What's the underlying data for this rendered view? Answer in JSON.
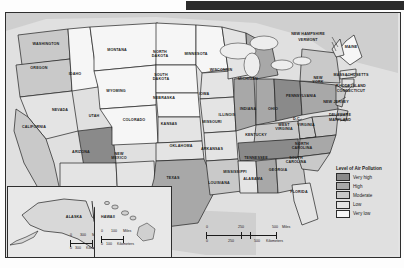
{
  "document": {
    "type": "thematic-choropleth-map",
    "region": "United States",
    "topic": "Level of Air Pollution"
  },
  "legend": {
    "title": "Level of Air Pollution",
    "items": [
      {
        "label": "Very high",
        "color": "#8a8a8a"
      },
      {
        "label": "High",
        "color": "#a8a8a8"
      },
      {
        "label": "Moderate",
        "color": "#c9c9c9"
      },
      {
        "label": "Low",
        "color": "#e4e4e4"
      },
      {
        "label": "Very low",
        "color": "#f6f6f6"
      }
    ]
  },
  "scales": {
    "main": {
      "miles": {
        "ticks": [
          "0",
          "250",
          "500"
        ],
        "unit": "Miles"
      },
      "kilometers": {
        "ticks": [
          "0",
          "250",
          "500"
        ],
        "unit": "Kilometers"
      }
    },
    "alaska": {
      "miles": {
        "ticks": [
          "0",
          "300"
        ],
        "unit": "Miles"
      },
      "kilometers": {
        "ticks": [
          "0",
          "300"
        ],
        "unit": "Kilometers"
      }
    },
    "hawaii": {
      "miles": {
        "ticks": [
          "0",
          "100"
        ],
        "unit": "Miles"
      },
      "kilometers": {
        "ticks": [
          "0",
          "100"
        ],
        "unit": "Kilometers"
      }
    }
  },
  "insets": {
    "alaska": {
      "label": "ALASKA"
    },
    "hawaii": {
      "label": "HAWAII"
    }
  },
  "states": [
    {
      "name": "WASHINGTON",
      "level": "Moderate",
      "x": 40,
      "y": 32,
      "size": "sm"
    },
    {
      "name": "OREGON",
      "level": "Moderate",
      "x": 33,
      "y": 56,
      "size": "sm"
    },
    {
      "name": "IDAHO",
      "level": "Very low",
      "x": 69,
      "y": 62,
      "size": "sm"
    },
    {
      "name": "MONTANA",
      "level": "Very low",
      "x": 111,
      "y": 38,
      "size": "sm"
    },
    {
      "name": "WYOMING",
      "level": "Very low",
      "x": 110,
      "y": 79,
      "size": "sm"
    },
    {
      "name": "NEVADA",
      "level": "Low",
      "x": 54,
      "y": 98,
      "size": "sm"
    },
    {
      "name": "UTAH",
      "level": "Very high",
      "x": 88,
      "y": 104,
      "size": "sm"
    },
    {
      "name": "CALIFORNIA",
      "level": "Moderate",
      "x": 28,
      "y": 115,
      "size": "sm"
    },
    {
      "name": "ARIZONA",
      "level": "Low",
      "x": 75,
      "y": 140,
      "size": "sm"
    },
    {
      "name": "NEW\nMEXICO",
      "level": "Low",
      "x": 113,
      "y": 142,
      "size": "sm"
    },
    {
      "name": "COLORADO",
      "level": "Very low",
      "x": 128,
      "y": 108,
      "size": "sm"
    },
    {
      "name": "NORTH\nDAKOTA",
      "level": "Very low",
      "x": 154,
      "y": 40,
      "size": "sm"
    },
    {
      "name": "SOUTH\nDAKOTA",
      "level": "Very low",
      "x": 155,
      "y": 63,
      "size": "sm"
    },
    {
      "name": "NEBRASKA",
      "level": "Very low",
      "x": 158,
      "y": 86,
      "size": "sm"
    },
    {
      "name": "KANSAS",
      "level": "Low",
      "x": 163,
      "y": 112,
      "size": "sm"
    },
    {
      "name": "OKLAHOMA",
      "level": "Low",
      "x": 175,
      "y": 134,
      "size": "sm"
    },
    {
      "name": "TEXAS",
      "level": "High",
      "x": 167,
      "y": 166,
      "size": "sm"
    },
    {
      "name": "MINNESOTA",
      "level": "Very low",
      "x": 190,
      "y": 42,
      "size": "sm"
    },
    {
      "name": "IOWA",
      "level": "Low",
      "x": 198,
      "y": 82,
      "size": "sm"
    },
    {
      "name": "MISSOURI",
      "level": "Low",
      "x": 206,
      "y": 110,
      "size": "sm"
    },
    {
      "name": "ARKANSAS",
      "level": "Low",
      "x": 206,
      "y": 137,
      "size": "sm"
    },
    {
      "name": "LOUISIANA",
      "level": "Moderate",
      "x": 213,
      "y": 171,
      "size": "sm"
    },
    {
      "name": "WISCONSIN",
      "level": "Low",
      "x": 215,
      "y": 58,
      "size": "sm"
    },
    {
      "name": "ILLINOIS",
      "level": "High",
      "x": 221,
      "y": 103,
      "size": "sm"
    },
    {
      "name": "MICHIGAN",
      "level": "High",
      "x": 242,
      "y": 67,
      "size": "sm"
    },
    {
      "name": "INDIANA",
      "level": "High",
      "x": 242,
      "y": 97,
      "size": "sm"
    },
    {
      "name": "OHIO",
      "level": "Very high",
      "x": 267,
      "y": 97,
      "size": "sm"
    },
    {
      "name": "KENTUCKY",
      "level": "Moderate",
      "x": 250,
      "y": 123,
      "size": "sm"
    },
    {
      "name": "TENNESSEE",
      "level": "Very high",
      "x": 250,
      "y": 146,
      "size": "sm"
    },
    {
      "name": "MISSISSIPPI",
      "level": "Low",
      "x": 229,
      "y": 160,
      "size": "sm"
    },
    {
      "name": "ALABAMA",
      "level": "High",
      "x": 247,
      "y": 167,
      "size": "sm"
    },
    {
      "name": "GEORGIA",
      "level": "Moderate",
      "x": 272,
      "y": 158,
      "size": "sm"
    },
    {
      "name": "FLORIDA",
      "level": "Low",
      "x": 293,
      "y": 180,
      "size": "sm"
    },
    {
      "name": "SOUTH\nCAROLINA",
      "level": "Moderate",
      "x": 290,
      "y": 146,
      "size": "sm"
    },
    {
      "name": "NORTH\nCAROLINA",
      "level": "Moderate",
      "x": 296,
      "y": 132,
      "size": "sm"
    },
    {
      "name": "WEST\nVIRGINIA",
      "level": "Moderate",
      "x": 278,
      "y": 113,
      "size": "sm"
    },
    {
      "name": "VIRGINIA",
      "level": "Moderate",
      "x": 300,
      "y": 113,
      "size": "sm"
    },
    {
      "name": "D.C.",
      "level": "",
      "x": 291,
      "y": 107,
      "size": "sm"
    },
    {
      "name": "PENNSYLVANIA",
      "level": "High",
      "x": 295,
      "y": 84,
      "size": "sm"
    },
    {
      "name": "NEW\nYORK",
      "level": "Moderate",
      "x": 312,
      "y": 66,
      "size": "sm"
    },
    {
      "name": "NEW JERSEY",
      "level": "",
      "x": 330,
      "y": 90,
      "size": "sm"
    },
    {
      "name": "DELAWARE",
      "level": "",
      "x": 334,
      "y": 103,
      "size": "sm"
    },
    {
      "name": "MARYLAND",
      "level": "",
      "x": 334,
      "y": 108,
      "size": "sm"
    },
    {
      "name": "MASSACHUSETTS",
      "level": "",
      "x": 345,
      "y": 63,
      "size": "sm"
    },
    {
      "name": "RHODE ISLAND",
      "level": "",
      "x": 345,
      "y": 74,
      "size": "sm"
    },
    {
      "name": "CONNECTICUT",
      "level": "",
      "x": 345,
      "y": 79,
      "size": "sm"
    },
    {
      "name": "NEW HAMPSHIRE",
      "level": "",
      "x": 302,
      "y": 22,
      "size": "sm"
    },
    {
      "name": "VERMONT",
      "level": "",
      "x": 302,
      "y": 28,
      "size": "sm"
    },
    {
      "name": "MAINE",
      "level": "Very low",
      "x": 345,
      "y": 35,
      "size": "sm"
    }
  ]
}
